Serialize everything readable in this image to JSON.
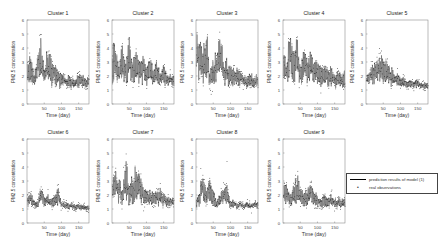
{
  "chart_data": {
    "type": "line",
    "layout": {
      "rows": 2,
      "cols": 5,
      "panels": 9
    },
    "shared": {
      "xlabel": "Time (day)",
      "ylabel": "PM2.5 concentration",
      "xlim": [
        0,
        180
      ],
      "ylim": [
        0,
        6
      ],
      "xticks": [
        50,
        100,
        150
      ],
      "yticks": [
        0,
        1,
        2,
        3,
        4,
        5,
        6
      ],
      "grid": false
    },
    "legend": {
      "position": "right, beside Cluster 9",
      "entries": [
        {
          "label": "prediction results of model (1)",
          "style": "solid-line",
          "color": "#000000"
        },
        {
          "label": "real observations",
          "style": "dot-marker",
          "color": "#000000"
        }
      ]
    },
    "panels": [
      {
        "title": "Cluster 1",
        "x": [
          0,
          10,
          20,
          30,
          40,
          50,
          60,
          70,
          80,
          90,
          100,
          110,
          120,
          130,
          140,
          150,
          160,
          170,
          180
        ],
        "series": [
          {
            "name": "prediction results of model (1)",
            "values": [
              2.0,
              2.8,
              1.7,
              2.6,
              3.6,
              1.9,
              2.9,
              2.3,
              2.2,
              1.9,
              1.8,
              1.6,
              1.7,
              1.5,
              1.5,
              1.7,
              1.7,
              1.5,
              1.6
            ]
          },
          {
            "name": "real observations",
            "values": [
              2.1,
              3.1,
              1.5,
              2.8,
              4.1,
              1.8,
              3.2,
              2.5,
              2.0,
              2.1,
              1.7,
              1.8,
              1.5,
              1.6,
              1.4,
              1.9,
              1.6,
              1.4,
              1.7
            ]
          }
        ]
      },
      {
        "title": "Cluster 2",
        "x": [
          0,
          10,
          20,
          30,
          40,
          50,
          60,
          70,
          80,
          90,
          100,
          110,
          120,
          130,
          140,
          150,
          160,
          170,
          180
        ],
        "series": [
          {
            "name": "prediction results of model (1)",
            "values": [
              3.5,
              2.8,
              2.2,
              3.0,
              2.4,
              3.4,
              2.2,
              2.7,
              2.3,
              2.8,
              2.0,
              2.4,
              1.9,
              2.3,
              1.8,
              2.1,
              1.6,
              1.7,
              1.6
            ]
          },
          {
            "name": "real observations",
            "values": [
              3.8,
              2.6,
              2.0,
              3.3,
              2.2,
              3.7,
              2.0,
              2.9,
              2.1,
              3.0,
              1.8,
              2.6,
              1.7,
              2.4,
              1.6,
              2.2,
              1.5,
              1.8,
              1.5
            ]
          }
        ]
      },
      {
        "title": "Cluster 3",
        "x": [
          0,
          10,
          20,
          30,
          40,
          50,
          60,
          70,
          80,
          90,
          100,
          110,
          120,
          130,
          140,
          150,
          160,
          170,
          180
        ],
        "series": [
          {
            "name": "prediction results of model (1)",
            "values": [
              4.2,
              3.2,
              2.6,
              3.8,
              1.8,
              2.3,
              2.6,
              3.6,
              2.2,
              2.3,
              2.0,
              1.9,
              2.0,
              1.8,
              1.7,
              1.6,
              1.7,
              1.6,
              1.6
            ]
          },
          {
            "name": "real observations",
            "values": [
              4.4,
              3.0,
              2.3,
              4.1,
              1.4,
              2.1,
              2.8,
              3.9,
              2.0,
              2.5,
              1.8,
              2.1,
              1.8,
              1.9,
              1.5,
              1.8,
              1.5,
              1.7,
              1.4
            ]
          }
        ]
      },
      {
        "title": "Cluster 4",
        "x": [
          0,
          10,
          20,
          30,
          40,
          50,
          60,
          70,
          80,
          90,
          100,
          110,
          120,
          130,
          140,
          150,
          160,
          170,
          180
        ],
        "series": [
          {
            "name": "prediction results of model (1)",
            "values": [
              3.0,
              2.2,
              3.8,
              2.4,
              3.4,
              2.1,
              3.0,
              2.3,
              2.8,
              2.2,
              2.3,
              2.0,
              2.1,
              1.9,
              2.0,
              1.8,
              1.9,
              1.7,
              1.8
            ]
          },
          {
            "name": "real observations",
            "values": [
              3.2,
              1.9,
              4.2,
              2.1,
              3.7,
              1.8,
              3.3,
              2.0,
              3.1,
              2.0,
              2.5,
              1.8,
              2.3,
              1.7,
              2.1,
              1.6,
              2.0,
              1.5,
              1.6
            ]
          }
        ]
      },
      {
        "title": "Cluster 5",
        "x": [
          0,
          10,
          20,
          30,
          40,
          50,
          60,
          70,
          80,
          90,
          100,
          110,
          120,
          130,
          140,
          150,
          160,
          170,
          180
        ],
        "series": [
          {
            "name": "prediction results of model (1)",
            "values": [
              1.6,
              1.9,
              2.2,
              2.3,
              2.6,
              2.3,
              2.2,
              2.0,
              1.9,
              1.7,
              1.6,
              1.5,
              1.4,
              1.5,
              1.4,
              1.5,
              1.3,
              1.3,
              1.3
            ]
          },
          {
            "name": "real observations",
            "values": [
              1.5,
              2.0,
              2.5,
              2.2,
              4.2,
              2.4,
              2.3,
              2.1,
              1.8,
              1.9,
              1.5,
              1.6,
              1.3,
              1.7,
              1.3,
              1.6,
              1.2,
              1.4,
              1.2
            ]
          }
        ]
      },
      {
        "title": "Cluster 6",
        "x": [
          0,
          10,
          20,
          30,
          40,
          50,
          60,
          70,
          80,
          90,
          100,
          110,
          120,
          130,
          140,
          150,
          160,
          170,
          180
        ],
        "series": [
          {
            "name": "prediction results of model (1)",
            "values": [
              1.5,
              1.8,
              1.4,
              1.3,
              2.1,
              1.5,
              1.7,
              1.4,
              1.6,
              2.0,
              1.3,
              1.3,
              1.2,
              1.2,
              1.1,
              1.2,
              1.1,
              1.1,
              1.1
            ]
          },
          {
            "name": "real observations",
            "values": [
              1.6,
              2.0,
              1.3,
              1.2,
              2.6,
              1.4,
              1.9,
              1.2,
              1.7,
              2.4,
              1.2,
              1.4,
              1.1,
              1.3,
              1.0,
              1.3,
              1.0,
              1.1,
              1.0
            ]
          }
        ]
      },
      {
        "title": "Cluster 7",
        "x": [
          0,
          10,
          20,
          30,
          40,
          50,
          60,
          70,
          80,
          90,
          100,
          110,
          120,
          130,
          140,
          150,
          160,
          170,
          180
        ],
        "series": [
          {
            "name": "prediction results of model (1)",
            "values": [
              2.2,
              2.6,
              2.4,
              1.8,
              3.2,
              2.1,
              2.4,
              2.8,
              2.5,
              2.0,
              1.9,
              1.8,
              1.7,
              1.8,
              1.9,
              1.7,
              1.6,
              1.5,
              1.5
            ]
          },
          {
            "name": "real observations",
            "values": [
              2.1,
              2.9,
              2.2,
              1.5,
              4.5,
              1.9,
              2.6,
              3.1,
              2.8,
              1.8,
              1.7,
              2.0,
              1.5,
              1.9,
              2.4,
              1.6,
              1.7,
              1.4,
              1.4
            ]
          }
        ]
      },
      {
        "title": "Cluster 8",
        "x": [
          0,
          10,
          20,
          30,
          40,
          50,
          60,
          70,
          80,
          90,
          100,
          110,
          120,
          130,
          140,
          150,
          160,
          170,
          180
        ],
        "series": [
          {
            "name": "prediction results of model (1)",
            "values": [
              1.4,
              1.9,
              2.7,
              2.0,
              2.3,
              1.9,
              1.3,
              1.7,
              1.9,
              2.1,
              1.3,
              1.4,
              1.2,
              1.3,
              1.2,
              1.3,
              1.2,
              1.3,
              1.3
            ]
          },
          {
            "name": "real observations",
            "values": [
              1.3,
              2.1,
              3.5,
              1.8,
              2.9,
              1.7,
              1.1,
              1.9,
              2.2,
              2.8,
              1.2,
              1.6,
              1.1,
              1.4,
              1.1,
              1.4,
              1.0,
              1.4,
              1.2
            ]
          }
        ]
      },
      {
        "title": "Cluster 9",
        "x": [
          0,
          10,
          20,
          30,
          40,
          50,
          60,
          70,
          80,
          90,
          100,
          110,
          120,
          130,
          140,
          150,
          160,
          170,
          180
        ],
        "series": [
          {
            "name": "prediction results of model (1)",
            "values": [
              2.0,
              2.3,
              1.6,
              2.0,
              2.5,
              1.9,
              1.7,
              1.8,
              2.2,
              1.8,
              1.6,
              1.4,
              1.6,
              1.5,
              1.6,
              1.4,
              1.5,
              1.4,
              1.5
            ]
          },
          {
            "name": "real observations",
            "values": [
              2.1,
              2.6,
              1.3,
              2.2,
              3.2,
              1.8,
              1.5,
              1.9,
              3.0,
              1.7,
              1.4,
              1.3,
              1.8,
              1.3,
              1.9,
              1.3,
              1.6,
              1.3,
              1.4
            ]
          }
        ]
      }
    ]
  },
  "legend": {
    "line_label": "prediction results of model (1)",
    "dot_label": "real observations",
    "dot_glyph": "•"
  }
}
